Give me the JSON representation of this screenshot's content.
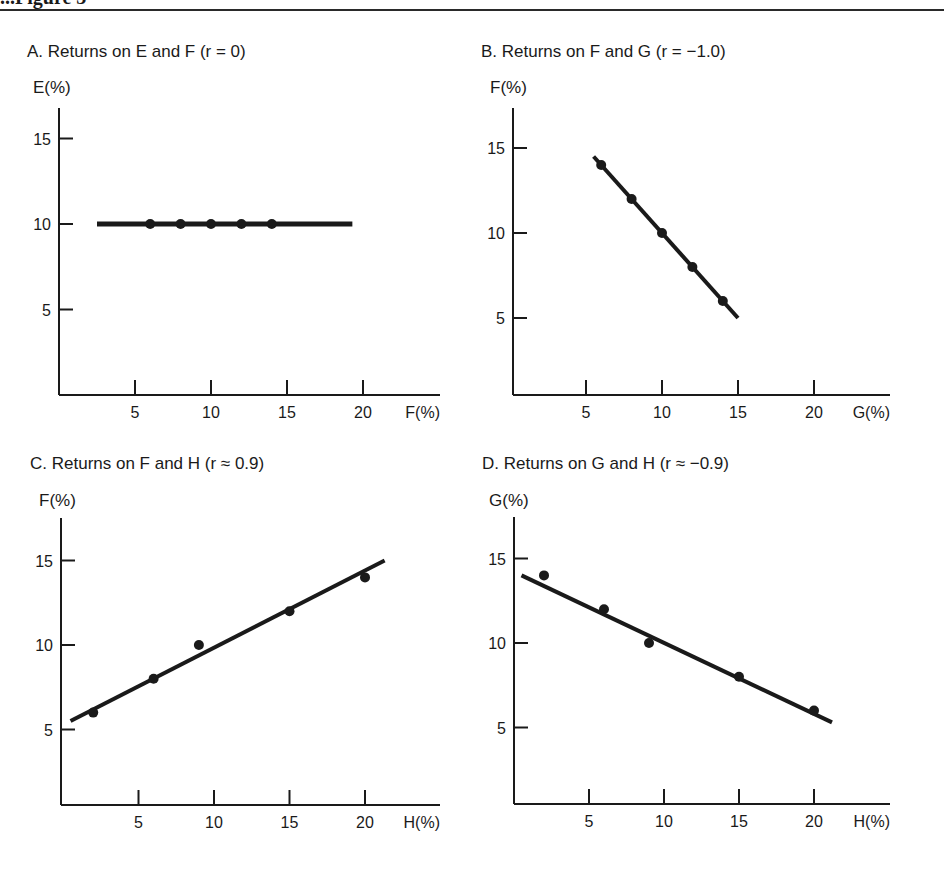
{
  "page": {
    "heading_fragment": "...Figure 3"
  },
  "chart_data": [
    {
      "id": "A",
      "type": "scatter",
      "title": "A.  Returns on E and F (r  =  0)",
      "xlabel": "F(%)",
      "ylabel": "E(%)",
      "x_ticks": [
        5,
        10,
        15,
        20
      ],
      "y_ticks": [
        5,
        10,
        15
      ],
      "xlim": [
        0,
        25
      ],
      "ylim": [
        0,
        17
      ],
      "grid": false,
      "points": [
        [
          6,
          10
        ],
        [
          8,
          10
        ],
        [
          10,
          10
        ],
        [
          12,
          10
        ],
        [
          14,
          10
        ]
      ],
      "fit_line": [
        [
          2.5,
          10
        ],
        [
          19.3,
          10
        ]
      ],
      "correlation": "r = 0"
    },
    {
      "id": "B",
      "type": "scatter",
      "title": "B.  Returns on F and G (r  =  −1.0)",
      "xlabel": "G(%)",
      "ylabel": "F(%)",
      "x_ticks": [
        5,
        10,
        15,
        20
      ],
      "y_ticks": [
        5,
        10,
        15
      ],
      "xlim": [
        0,
        25
      ],
      "ylim": [
        0,
        17
      ],
      "grid": false,
      "points": [
        [
          6,
          14
        ],
        [
          8,
          12
        ],
        [
          10,
          10
        ],
        [
          12,
          8
        ],
        [
          14,
          6
        ]
      ],
      "fit_line": [
        [
          5.5,
          14.5
        ],
        [
          15,
          5
        ]
      ],
      "correlation": "r = −1.0"
    },
    {
      "id": "C",
      "type": "scatter",
      "title": "C.  Returns on F and H (r ≈ 0.9)",
      "xlabel": "H(%)",
      "ylabel": "F(%)",
      "x_ticks": [
        5,
        10,
        15,
        20
      ],
      "y_ticks": [
        5,
        10,
        15
      ],
      "xlim": [
        0,
        25
      ],
      "ylim": [
        0,
        17
      ],
      "grid": false,
      "points": [
        [
          2,
          6
        ],
        [
          6,
          8
        ],
        [
          9,
          10
        ],
        [
          15,
          12
        ],
        [
          20,
          14
        ]
      ],
      "fit_line": [
        [
          0.5,
          5.5
        ],
        [
          21.3,
          15
        ]
      ],
      "correlation": "r ≈ 0.9"
    },
    {
      "id": "D",
      "type": "scatter",
      "title": "D.  Returns on G and H (r ≈ −0.9)",
      "xlabel": "H(%)",
      "ylabel": "G(%)",
      "x_ticks": [
        5,
        10,
        15,
        20
      ],
      "y_ticks": [
        5,
        10,
        15
      ],
      "xlim": [
        0,
        25
      ],
      "ylim": [
        0,
        17
      ],
      "grid": false,
      "points": [
        [
          2,
          14
        ],
        [
          6,
          12
        ],
        [
          9,
          10
        ],
        [
          15,
          8
        ],
        [
          20,
          6
        ]
      ],
      "fit_line": [
        [
          0.5,
          14
        ],
        [
          21.2,
          5.3
        ]
      ],
      "correlation": "r ≈ −0.9"
    }
  ],
  "layout": {
    "panels": [
      {
        "title_x": 27,
        "title_y": 57,
        "ylabel_x": 33,
        "ylabel_y": 93,
        "axis_x": 59,
        "axis_top": 108,
        "axis_right": 440,
        "x0": 59,
        "y0": 395,
        "px_per_x": 15.2,
        "px_per_y": 17.1
      },
      {
        "title_x": 481,
        "title_y": 57,
        "ylabel_x": 490,
        "ylabel_y": 93,
        "axis_x": 513,
        "axis_top": 108,
        "axis_right": 890,
        "x0": 510,
        "y0": 403,
        "px_per_x": 15.2,
        "px_per_y": 17.0
      },
      {
        "title_x": 30,
        "title_y": 469,
        "ylabel_x": 39,
        "ylabel_y": 506,
        "axis_x": 61,
        "axis_top": 518,
        "axis_right": 440,
        "x0": 63,
        "y0": 814,
        "px_per_x": 15.1,
        "px_per_y": 16.9
      },
      {
        "title_x": 482,
        "title_y": 469,
        "ylabel_x": 489,
        "ylabel_y": 506,
        "axis_x": 514,
        "axis_top": 517,
        "axis_right": 890,
        "x0": 514,
        "y0": 812,
        "px_per_x": 15.0,
        "px_per_y": 16.9
      }
    ]
  }
}
